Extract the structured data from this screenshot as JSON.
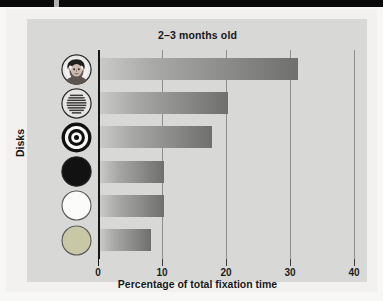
{
  "figure": {
    "title": "2–3 months old",
    "x_axis_label": "Percentage of total fixation time",
    "y_axis_label": "Disks"
  },
  "chart_data": {
    "type": "bar",
    "orientation": "horizontal",
    "title": "2–3 months old",
    "xlabel": "Percentage of total fixation time",
    "ylabel": "Disks",
    "xlim": [
      0,
      40
    ],
    "xticks": [
      0,
      10,
      20,
      30,
      40
    ],
    "xtick_labels": [
      "0",
      "10",
      "20",
      "30",
      "40"
    ],
    "grid": true,
    "legend": "none",
    "categories": [
      "face",
      "newsprint",
      "bullseye",
      "black",
      "white",
      "yellow"
    ],
    "category_labels": [
      "Face disk",
      "Printed-text disk",
      "Bull's-eye disk",
      "Plain black disk",
      "Plain white disk",
      "Plain yellow disk"
    ],
    "values": [
      31,
      20,
      17.5,
      10,
      10,
      8
    ]
  },
  "ticks": [
    {
      "value": 0,
      "label": "0"
    },
    {
      "value": 10,
      "label": "10"
    },
    {
      "value": 20,
      "label": "20"
    },
    {
      "value": 30,
      "label": "30"
    },
    {
      "value": 40,
      "label": "40"
    }
  ],
  "bars": [
    {
      "name": "face",
      "value": 31
    },
    {
      "name": "newsprint",
      "value": 20
    },
    {
      "name": "bullseye",
      "value": 17.5
    },
    {
      "name": "black",
      "value": 10
    },
    {
      "name": "white",
      "value": 10
    },
    {
      "name": "yellow",
      "value": 8
    }
  ],
  "disks": [
    {
      "name": "face-disk",
      "icon": "face-disk-icon"
    },
    {
      "name": "newsprint-disk",
      "icon": "newsprint-disk-icon"
    },
    {
      "name": "bullseye-disk",
      "icon": "bullseye-disk-icon"
    },
    {
      "name": "black-disk",
      "icon": "black-disk-icon"
    },
    {
      "name": "white-disk",
      "icon": "white-disk-icon"
    },
    {
      "name": "yellow-disk",
      "icon": "yellow-disk-icon"
    }
  ],
  "colors": {
    "panel": "#d8d8d6",
    "figure": "#f2f1ef",
    "axis": "#15151a",
    "grid": "#8e8e8e",
    "bar_light": "#c9c9c8",
    "bar_dark": "#6f6f6e",
    "black_disk": "#121212",
    "white_disk": "#fbfbfa",
    "yellow_disk": "#c9c9a8"
  }
}
